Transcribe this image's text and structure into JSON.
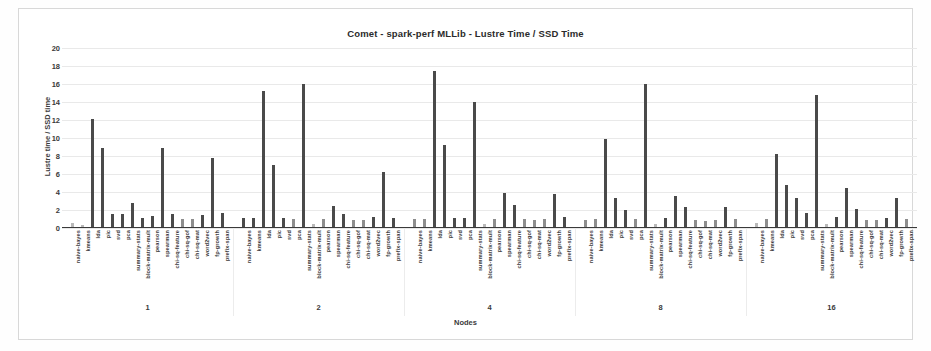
{
  "chart_data": {
    "type": "bar",
    "title": "Comet - spark-perf MLLib - Lustre Time / SSD Time",
    "xlabel": "Nodes",
    "ylabel": "Lustre time / SSD time",
    "ylim": [
      0,
      20
    ],
    "yticks": [
      0,
      2,
      4,
      6,
      8,
      10,
      12,
      14,
      16,
      18,
      20
    ],
    "grid": true,
    "legend": "none",
    "groups": [
      "1",
      "2",
      "4",
      "8",
      "16"
    ],
    "categories": [
      "naive-bayes",
      "kmeans",
      "lda",
      "pic",
      "svd",
      "pca",
      "summary-stats",
      "block-matrix-mult",
      "pearson",
      "spearman",
      "chi-sq-feature",
      "chi-sq-gof",
      "chi-sq-mat",
      "word2vec",
      "fp-growth",
      "prefix-span"
    ],
    "series": [
      {
        "name": "1",
        "values": [
          0.6,
          0.35,
          12.1,
          8.9,
          1.6,
          1.6,
          2.8,
          1.1,
          1.3,
          8.9,
          1.6,
          1.0,
          1.0,
          1.5,
          7.8,
          1.7
        ]
      },
      {
        "name": "2",
        "values": [
          1.1,
          1.1,
          15.2,
          7.0,
          1.1,
          1.0,
          16.0,
          0.4,
          1.0,
          2.5,
          1.6,
          0.9,
          0.9,
          1.2,
          6.2,
          1.1
        ]
      },
      {
        "name": "4",
        "values": [
          1.0,
          1.0,
          17.4,
          9.2,
          1.1,
          1.1,
          14.0,
          0.4,
          1.0,
          3.9,
          2.6,
          1.0,
          0.9,
          1.0,
          3.8,
          1.2
        ]
      },
      {
        "name": "8",
        "values": [
          0.9,
          1.0,
          9.9,
          3.3,
          2.0,
          1.0,
          16.0,
          0.5,
          1.1,
          3.6,
          2.3,
          0.9,
          0.8,
          0.9,
          2.3,
          1.0
        ]
      },
      {
        "name": "16",
        "values": [
          0.6,
          1.0,
          8.2,
          4.8,
          3.3,
          1.7,
          14.8,
          0.5,
          1.2,
          4.5,
          2.1,
          0.9,
          0.9,
          1.1,
          3.3,
          1.0
        ]
      }
    ],
    "colors": {
      "bar": "#4a4a4a",
      "bar_light": "#b9b9b9",
      "axis": "#3a3a3a",
      "grid": "#e9e9e9",
      "background": "#ffffff"
    }
  }
}
